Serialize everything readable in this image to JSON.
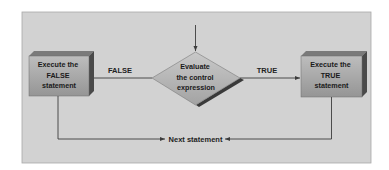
{
  "diagram": {
    "type": "flowchart",
    "title": "",
    "colors": {
      "panel": "#d2d2d2",
      "panel_border": "#a9a9a9",
      "box_face_top": "#b9b9b9",
      "box_face_bottom": "#9c9c9c",
      "box_side": "#4a4a4a",
      "box_top": "#7a7a7a",
      "line": "#3c3c3c"
    },
    "nodes": {
      "decision": {
        "shape": "diamond",
        "lines": [
          "Evaluate",
          "the control",
          "expression"
        ]
      },
      "false_branch": {
        "shape": "box",
        "lines": [
          "Execute the",
          "FALSE",
          "statement"
        ]
      },
      "true_branch": {
        "shape": "box",
        "lines": [
          "Execute the",
          "TRUE",
          "statement"
        ]
      },
      "next": {
        "shape": "label",
        "text": "Next statement"
      }
    },
    "edges": [
      {
        "from": "entry",
        "to": "decision",
        "label": ""
      },
      {
        "from": "decision",
        "to": "false_branch",
        "label": "FALSE"
      },
      {
        "from": "decision",
        "to": "true_branch",
        "label": "TRUE"
      },
      {
        "from": "false_branch",
        "to": "next",
        "label": ""
      },
      {
        "from": "true_branch",
        "to": "next",
        "label": ""
      }
    ]
  }
}
